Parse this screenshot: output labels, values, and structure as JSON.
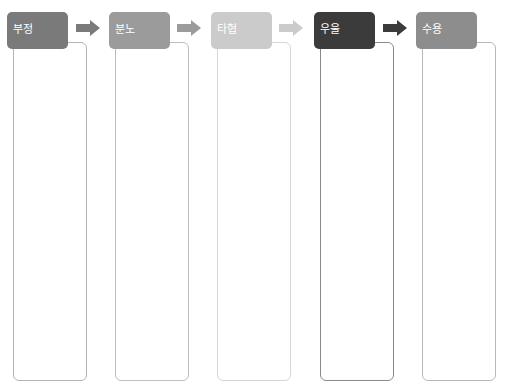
{
  "diagram": {
    "type": "process-flow",
    "top_cut_text": "",
    "stages": [
      {
        "label": "부정",
        "header_color": "#7a7a7a",
        "arrow_color": "#7a7a7a",
        "border_color": "#b3b3b3"
      },
      {
        "label": "분노",
        "header_color": "#9b9b9b",
        "arrow_color": "#9b9b9b",
        "border_color": "#bdbdbd"
      },
      {
        "label": "타협",
        "header_color": "#cbcbcb",
        "arrow_color": "#cbcbcb",
        "border_color": "#d6d6d6"
      },
      {
        "label": "우울",
        "header_color": "#3b3b3b",
        "arrow_color": "#3b3b3b",
        "border_color": "#8a8a8a"
      },
      {
        "label": "수용",
        "header_color": "#8d8d8d",
        "arrow_color": null,
        "border_color": "#b8b8b8"
      }
    ]
  }
}
